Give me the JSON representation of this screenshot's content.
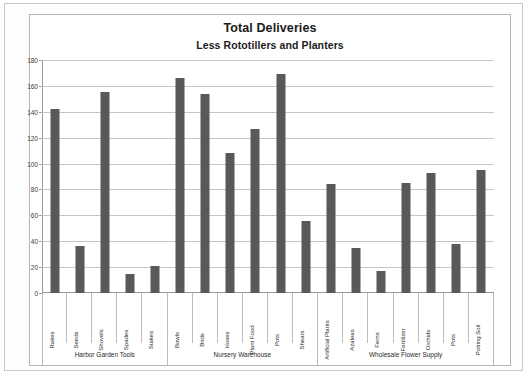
{
  "chart_data": {
    "type": "bar",
    "title": "Total Deliveries",
    "subtitle": "Less Rototillers and Planters",
    "xlabel": "",
    "ylabel": "",
    "ylim": [
      0,
      180
    ],
    "ytick_step": 20,
    "yticks": [
      0,
      20,
      40,
      60,
      80,
      100,
      120,
      140,
      160,
      180
    ],
    "grid": true,
    "legend": false,
    "bar_color": "#595959",
    "categories": [
      "Rakes",
      "Seeds",
      "Shovels",
      "Spades",
      "Stakes",
      "Bowls",
      "Birds",
      "Hoses",
      "Plant Food",
      "Pots",
      "Shears",
      "Artificial Plants",
      "Azaleas",
      "Ferns",
      "Fertilizer",
      "Orchids",
      "Pots",
      "Potting Soil"
    ],
    "values": [
      142,
      36,
      155,
      15,
      21,
      166,
      154,
      108,
      127,
      169,
      56,
      84,
      35,
      17,
      85,
      93,
      38,
      95
    ],
    "groups": [
      {
        "label": "Harbor Garden Tools",
        "count": 5
      },
      {
        "label": "Nursery Warehouse",
        "count": 6
      },
      {
        "label": "Wholesale Flower Supply",
        "count": 7
      }
    ]
  }
}
